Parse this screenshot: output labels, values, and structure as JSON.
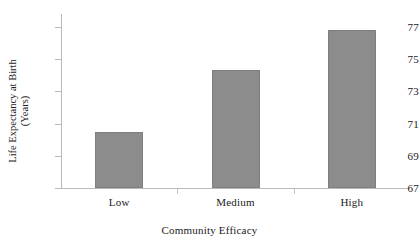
{
  "chart_data": {
    "type": "bar",
    "title": "",
    "subtitle": "",
    "xlabel": "Community Efficacy",
    "ylabel": "Life Expectancy at Birth (Years)",
    "ylabel_lines": [
      "Life Expectancy at Birth",
      "(Years)"
    ],
    "categories": [
      "Low",
      "Medium",
      "High"
    ],
    "values": [
      70.5,
      74.3,
      76.8
    ],
    "series": [
      {
        "name": "Life Expectancy at Birth",
        "values": [
          70.5,
          74.3,
          76.8
        ]
      }
    ],
    "ylim": [
      67,
      77.8
    ],
    "yticks": [
      67,
      69,
      71,
      73,
      75,
      77
    ],
    "ytick_labels": [
      "67",
      "69",
      "71",
      "73",
      "75",
      "77"
    ],
    "grid": false,
    "legend": null,
    "legend_position": "none",
    "bar_color": "#8c8c8c",
    "bar_edge_color": "#7f7f7f",
    "axis_color": "#b9b9b9",
    "text_color": "#1a1a1a",
    "background_color": "#ffffff"
  }
}
